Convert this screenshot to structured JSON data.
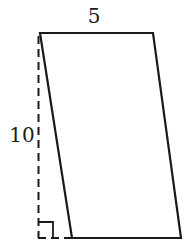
{
  "diagram": {
    "type": "parallelogram",
    "labels": {
      "top_side": "5",
      "height": "10"
    },
    "colors": {
      "stroke": "#1a1a1a",
      "background": "#ffffff"
    },
    "annotations": {
      "height_line": "dashed",
      "right_angle_marker": true
    }
  }
}
